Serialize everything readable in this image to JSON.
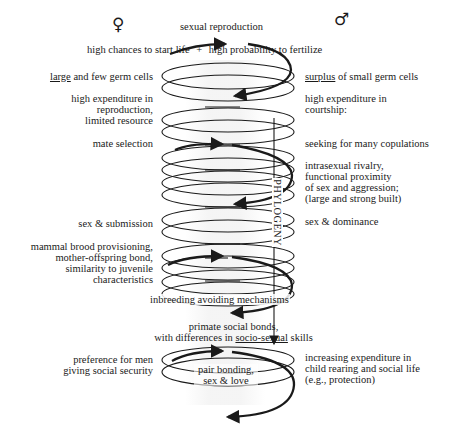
{
  "symbols": {
    "female": "♀",
    "male": "♂"
  },
  "top": {
    "title": "sexual reproduction",
    "subtitle_left": "high chances to start life",
    "subtitle_plus": "+",
    "subtitle_right": "high probability to fertilize"
  },
  "axis": {
    "label": "PHYLOGENY"
  },
  "female_side": [
    {
      "underlined": "large",
      "text": " and few germ cells"
    },
    {
      "lines": [
        "high expenditure in",
        "reproduction,",
        "limited resource"
      ]
    },
    {
      "text": "mate selection"
    },
    {
      "text": "sex & submission"
    },
    {
      "lines": [
        "mammal brood provisioning,",
        "mother-offspring bond,",
        "similarity to juvenile",
        "characteristics"
      ]
    },
    {
      "lines": [
        "preference for men",
        "giving social security"
      ]
    }
  ],
  "male_side": [
    {
      "underlined": "surplus",
      "text": " of small germ cells"
    },
    {
      "lines": [
        "high expenditure in",
        "courtship:"
      ]
    },
    {
      "text": "seeking for many copulations"
    },
    {
      "lines": [
        "intrasexual rivalry,",
        "functional proximity",
        "of sex and aggression;",
        "(large and strong built)"
      ]
    },
    {
      "text": "sex & dominance"
    },
    {
      "lines": [
        "increasing expenditure in",
        "child rearing and social life",
        "(e.g., protection)"
      ]
    }
  ],
  "center": {
    "inbreeding": "inbreeding avoiding mechanisms",
    "primate_line1": "primate social bonds,",
    "primate_line2_pre": "with differences in ",
    "primate_line2_ul": "socio-sexual",
    "primate_line2_post": " skills",
    "pair_line1": "pair bonding,",
    "pair_line2": "sex & love"
  },
  "colors": {
    "ink": "#1a1a1a",
    "background": "#ffffff",
    "column_shade": "#ececec"
  }
}
